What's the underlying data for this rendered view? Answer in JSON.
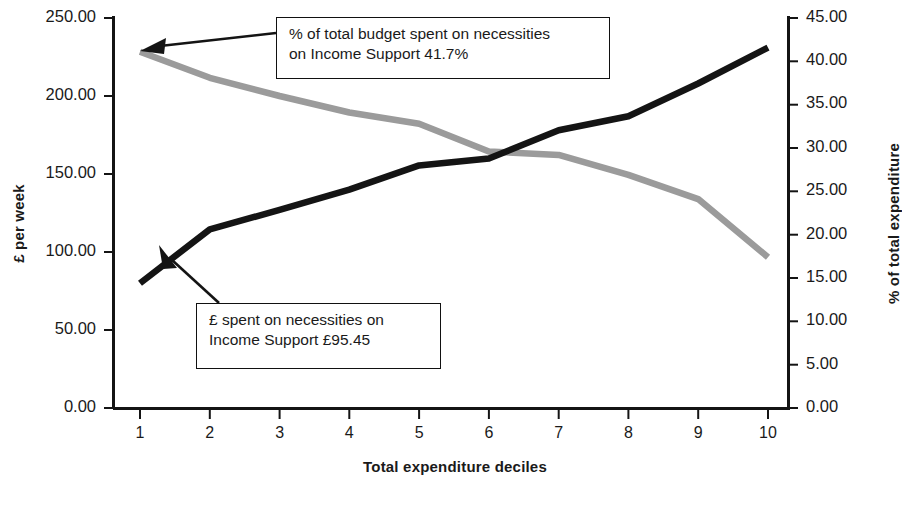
{
  "figure": {
    "xlabel": "Total expenditure deciles",
    "ylabel_left": "£ per week",
    "ylabel_right": "% of total expenditure"
  },
  "annotations": {
    "pct": {
      "line1": "% of total budget spent on necessities",
      "line2": "on Income Support 41.7%"
    },
    "gbp": {
      "line1": "£ spent on necessities on",
      "line2": "Income Support £95.45"
    }
  },
  "axes": {
    "left_ticks": [
      "250.00",
      "200.00",
      "150.00",
      "100.00",
      "50.00",
      "0.00"
    ],
    "right_ticks": [
      "45.00",
      "40.00",
      "35.00",
      "30.00",
      "25.00",
      "20.00",
      "15.00",
      "10.00",
      "5.00",
      "0.00"
    ],
    "x_ticks": [
      "1",
      "2",
      "3",
      "4",
      "5",
      "6",
      "7",
      "8",
      "9",
      "10"
    ]
  },
  "colors": {
    "series_gbp": "#141414",
    "series_pct": "#9b9b9b",
    "axis": "#141414",
    "text": "#1a1a1a"
  },
  "chart_data": {
    "type": "line",
    "title": "",
    "xlabel": "Total expenditure deciles",
    "ylabel": "£ per week",
    "ylabel_secondary": "% of total expenditure",
    "grid": false,
    "legend": "none",
    "categories": [
      "1",
      "2",
      "3",
      "4",
      "5",
      "6",
      "7",
      "8",
      "9",
      "10"
    ],
    "ylim": [
      0,
      250
    ],
    "ylim_secondary": [
      0,
      45
    ],
    "yticks": [
      0,
      50,
      100,
      150,
      200,
      250
    ],
    "yticks_secondary": [
      0,
      5,
      10,
      15,
      20,
      25,
      30,
      35,
      40,
      45
    ],
    "series": [
      {
        "name": "£ spent on necessities",
        "axis": "left",
        "color": "#141414",
        "unit": "£ per week",
        "values": [
          80.0,
          114.5,
          127.0,
          140.0,
          155.5,
          160.0,
          178.0,
          187.0,
          208.0,
          231.0
        ]
      },
      {
        "name": "% of total budget spent on necessities",
        "axis": "right",
        "color": "#9b9b9b",
        "unit": "% of total expenditure",
        "values": [
          41.1,
          38.1,
          36.0,
          34.1,
          32.8,
          29.6,
          29.2,
          26.9,
          24.1,
          17.4
        ]
      }
    ],
    "annotations": [
      {
        "text": "% of total budget spent on necessities on Income Support 41.7%",
        "points_to_series": "% of total budget spent on necessities",
        "points_to_category": "1",
        "value": 41.7
      },
      {
        "text": "£ spent on necessities on Income Support £95.45",
        "points_to_series": "£ spent on necessities",
        "points_to_category": "1",
        "value": 95.45
      }
    ]
  }
}
